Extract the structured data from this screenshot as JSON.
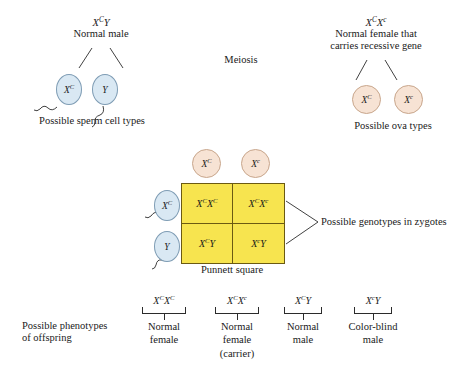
{
  "figure": {
    "title_hidden": "X-linked inheritance of color blindness",
    "meiosis_label": "Meiosis"
  },
  "father": {
    "genotype": "X",
    "genotype_sup1": "C",
    "genotype_rest": "Y",
    "description": "Normal male",
    "gametes_label": "Possible sperm cell types",
    "gametes": [
      {
        "base": "X",
        "sup": "C"
      },
      {
        "base": "Y",
        "sup": ""
      }
    ]
  },
  "mother": {
    "genotype_p1": "X",
    "genotype_s1": "C",
    "genotype_p2": "X",
    "genotype_s2": "c",
    "description_line1": "Normal female that",
    "description_line2": "carries recessive gene",
    "gametes_label": "Possible ova types",
    "gametes": [
      {
        "base": "X",
        "sup": "C"
      },
      {
        "base": "X",
        "sup": "c"
      }
    ]
  },
  "punnett": {
    "caption": "Punnett square",
    "column_gametes": [
      {
        "base": "X",
        "sup": "C"
      },
      {
        "base": "X",
        "sup": "c"
      }
    ],
    "row_gametes": [
      {
        "base": "X",
        "sup": "C"
      },
      {
        "base": "Y",
        "sup": ""
      }
    ],
    "cells": [
      {
        "p1": "X",
        "s1": "C",
        "p2": "X",
        "s2": "C"
      },
      {
        "p1": "X",
        "s1": "C",
        "p2": "X",
        "s2": "c"
      },
      {
        "p1": "X",
        "s1": "C",
        "p2": "Y",
        "s2": ""
      },
      {
        "p1": "X",
        "s1": "c",
        "p2": "Y",
        "s2": ""
      }
    ],
    "zygotes_label": "Possible genotypes in zygotes"
  },
  "phenotypes": {
    "heading_line1": "Possible phenotypes",
    "heading_line2": "of offspring",
    "items": [
      {
        "p1": "X",
        "s1": "C",
        "p2": "X",
        "s2": "C",
        "line1": "Normal",
        "line2": "female",
        "line3": ""
      },
      {
        "p1": "X",
        "s1": "C",
        "p2": "X",
        "s2": "c",
        "line1": "Normal",
        "line2": "female",
        "line3": "(carrier)"
      },
      {
        "p1": "X",
        "s1": "C",
        "p2": "Y",
        "s2": "",
        "line1": "Normal",
        "line2": "male",
        "line3": ""
      },
      {
        "p1": "X",
        "s1": "c",
        "p2": "Y",
        "s2": "",
        "line1": "Color-blind",
        "line2": "male",
        "line3": ""
      }
    ]
  },
  "colors": {
    "punnett_fill": "#f7e44f",
    "punnett_border": "#6b5a12",
    "sperm_fill": "#d9e8f3",
    "sperm_border": "#7e9cb4",
    "ovum_fill": "#f7e3d4",
    "ovum_border": "#c8a68c",
    "text": "#1a1a1a",
    "line": "#2b2b2b",
    "background": "#ffffff"
  }
}
